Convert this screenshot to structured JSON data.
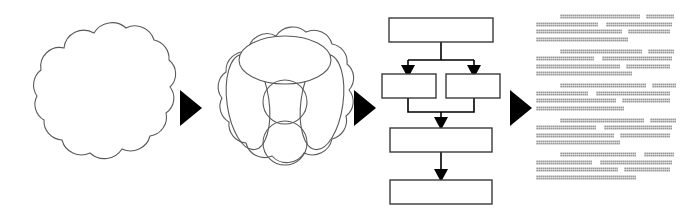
{
  "diagram": {
    "type": "flow-pipeline",
    "orientation": "left-to-right",
    "background_color": "#ffffff",
    "stroke_color": "#4a4a4a",
    "fill_color": "#ffffff",
    "arrow_color": "#000000",
    "text_color": "#9a9a9a",
    "stages": [
      {
        "id": "stage-1",
        "name": "unstructured-data-cloud",
        "shape": "cloud",
        "label": ""
      },
      {
        "id": "stage-2",
        "name": "clustered-data-cloud",
        "shape": "cloud-with-ellipses",
        "label": ""
      },
      {
        "id": "stage-3",
        "name": "process-flowchart",
        "shape": "flowchart",
        "label": ""
      },
      {
        "id": "stage-4",
        "name": "generated-text-document",
        "shape": "text-lines",
        "label": ""
      }
    ],
    "connectors": [
      {
        "id": "arrow-1",
        "name": "stage-1-to-stage-2",
        "glyph": "solid-right-triangle"
      },
      {
        "id": "arrow-2",
        "name": "stage-2-to-stage-3",
        "glyph": "solid-right-triangle"
      },
      {
        "id": "arrow-3",
        "name": "stage-3-to-stage-4",
        "glyph": "solid-right-triangle"
      }
    ]
  },
  "cloud_plain": {
    "name": "cloud-outline",
    "lobes": 11,
    "width": 148,
    "height": 140
  },
  "cloud_clustered": {
    "name": "cloud-with-clusters",
    "width": 148,
    "height": 150,
    "clusters": [
      {
        "name": "cluster-top-ellipse",
        "shape": "ellipse",
        "rx": 44,
        "ry": 23,
        "cx": 74,
        "cy": 44,
        "rotate": 0
      },
      {
        "name": "cluster-left-ellipse",
        "shape": "ellipse",
        "rx": 21,
        "ry": 48,
        "cx": 38,
        "cy": 85,
        "rotate": -8
      },
      {
        "name": "cluster-right-ellipse",
        "shape": "ellipse",
        "rx": 21,
        "ry": 48,
        "cx": 110,
        "cy": 85,
        "rotate": 8
      },
      {
        "name": "cluster-center-upper-circle",
        "shape": "circle",
        "r": 21,
        "cx": 74,
        "cy": 82
      },
      {
        "name": "cluster-center-lower-circle",
        "shape": "circle",
        "r": 21,
        "cx": 74,
        "cy": 122
      }
    ]
  },
  "flowchart": {
    "name": "process-flowchart",
    "box_fill": "#ffffff",
    "box_stroke": "#3a3a3a",
    "line_color": "#000000",
    "nodes": [
      {
        "id": "node-1",
        "name": "flow-box-top",
        "label": "",
        "x": 6,
        "y": 6,
        "w": 98,
        "h": 24
      },
      {
        "id": "node-2",
        "name": "flow-box-branch-left",
        "label": "",
        "x": 0,
        "y": 62,
        "w": 56,
        "h": 24
      },
      {
        "id": "node-3",
        "name": "flow-box-branch-right",
        "label": "",
        "x": 62,
        "y": 62,
        "w": 56,
        "h": 24
      },
      {
        "id": "node-4",
        "name": "flow-box-merge",
        "label": "",
        "x": 8,
        "y": 116,
        "w": 98,
        "h": 24
      },
      {
        "id": "node-5",
        "name": "flow-box-bottom",
        "label": "",
        "x": 8,
        "y": 168,
        "w": 98,
        "h": 24
      }
    ],
    "edges": [
      {
        "name": "edge-top-to-split",
        "from": "node-1",
        "to": "split",
        "arrow": false
      },
      {
        "name": "edge-split-to-left",
        "from": "split",
        "to": "node-2",
        "arrow": true
      },
      {
        "name": "edge-split-to-right",
        "from": "split",
        "to": "node-3",
        "arrow": true
      },
      {
        "name": "edge-left-to-merge",
        "from": "node-2",
        "to": "join",
        "arrow": false
      },
      {
        "name": "edge-right-to-merge",
        "from": "node-3",
        "to": "join",
        "arrow": false
      },
      {
        "name": "edge-join-to-merge",
        "from": "join",
        "to": "node-4",
        "arrow": true
      },
      {
        "name": "edge-merge-to-bottom",
        "from": "node-4",
        "to": "node-5",
        "arrow": true
      }
    ]
  },
  "text_block": {
    "name": "document-text",
    "line_color": "#9a9a9a",
    "paragraph_count": 5,
    "lines_per_paragraph": 4,
    "paragraphs": [
      {
        "name": "paragraph-1",
        "lines": [
          [
            {
              "gap": 24
            },
            {
              "seg": 80
            },
            {
              "gap": 6
            },
            {
              "seg": 28
            }
          ],
          [
            {
              "seg": 62
            },
            {
              "gap": 8
            },
            {
              "seg": 66
            }
          ],
          [
            {
              "seg": 86
            },
            {
              "gap": 6
            },
            {
              "seg": 42
            }
          ],
          [
            {
              "seg": 92
            }
          ]
        ]
      },
      {
        "name": "paragraph-2",
        "lines": [
          [
            {
              "gap": 24
            },
            {
              "seg": 82
            },
            {
              "gap": 6
            },
            {
              "seg": 26
            }
          ],
          [
            {
              "seg": 58
            },
            {
              "gap": 8
            },
            {
              "seg": 70
            }
          ],
          [
            {
              "seg": 84
            },
            {
              "gap": 6
            },
            {
              "seg": 44
            }
          ],
          [
            {
              "seg": 96
            }
          ]
        ]
      },
      {
        "name": "paragraph-3",
        "lines": [
          [
            {
              "gap": 24
            },
            {
              "seg": 86
            },
            {
              "gap": 6
            },
            {
              "seg": 24
            }
          ],
          [
            {
              "seg": 52
            },
            {
              "gap": 8
            },
            {
              "seg": 74
            }
          ],
          [
            {
              "seg": 80
            },
            {
              "gap": 6
            },
            {
              "seg": 48
            }
          ],
          [
            {
              "seg": 88
            }
          ]
        ]
      },
      {
        "name": "paragraph-4",
        "lines": [
          [
            {
              "gap": 24
            },
            {
              "seg": 84
            },
            {
              "gap": 6
            },
            {
              "seg": 26
            }
          ],
          [
            {
              "seg": 60
            },
            {
              "gap": 8
            },
            {
              "seg": 68
            }
          ],
          [
            {
              "seg": 78
            },
            {
              "gap": 6
            },
            {
              "seg": 50
            }
          ],
          [
            {
              "seg": 84
            }
          ]
        ]
      },
      {
        "name": "paragraph-5",
        "lines": [
          [
            {
              "gap": 24
            },
            {
              "seg": 76
            },
            {
              "gap": 8
            },
            {
              "seg": 30
            }
          ],
          [
            {
              "seg": 56
            },
            {
              "gap": 8
            },
            {
              "seg": 72
            }
          ],
          [
            {
              "seg": 82
            },
            {
              "gap": 6
            },
            {
              "seg": 46
            }
          ],
          [
            {
              "seg": 100
            }
          ]
        ]
      }
    ]
  }
}
